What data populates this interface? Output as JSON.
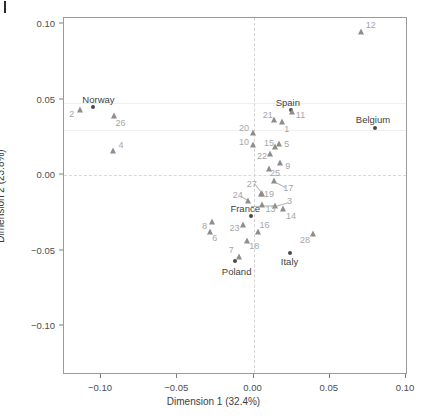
{
  "chart_data": {
    "type": "scatter",
    "title": "",
    "xlabel": "Dimension 1 (32.4%)",
    "ylabel": "Dimension 2 (23.8%)",
    "xlim": [
      -0.125,
      0.102
    ],
    "ylim": [
      -0.122,
      0.103
    ],
    "xticks": [
      -0.1,
      -0.05,
      0.0,
      0.05,
      0.1
    ],
    "xticklabels": [
      "-0.10",
      "-0.05",
      "0.00",
      "0.05",
      "0.10"
    ],
    "yticks": [
      0.1,
      0.05,
      0.0,
      -0.05,
      -0.1
    ],
    "yticklabels": [
      "0.10",
      "0.05",
      "0.00",
      "-0.05",
      "-0.10"
    ],
    "grid": false,
    "reference_lines": [
      {
        "axis": "x",
        "value": 0.0,
        "style": "dashed"
      },
      {
        "axis": "y",
        "value": 0.0,
        "style": "dashed"
      }
    ],
    "series": [
      {
        "name": "countries",
        "marker": "circle",
        "color": "#4a4a4a",
        "points": [
          {
            "label": "Norway",
            "x": -0.1045,
            "y": 0.0447,
            "lx": -0.101,
            "ly": 0.05
          },
          {
            "label": "Spain",
            "x": 0.025,
            "y": 0.0425,
            "lx": 0.0232,
            "ly": 0.048
          },
          {
            "label": "Belgium",
            "x": 0.08,
            "y": 0.0303,
            "lx": 0.079,
            "ly": 0.0365
          },
          {
            "label": "France",
            "x": -0.0013,
            "y": -0.0277,
            "lx": -0.0048,
            "ly": -0.0228
          },
          {
            "label": "Italy",
            "x": 0.0248,
            "y": -0.052,
            "lx": 0.0243,
            "ly": -0.0578
          },
          {
            "label": "Poland",
            "x": -0.0112,
            "y": -0.0578,
            "lx": -0.0104,
            "ly": -0.064
          }
        ]
      },
      {
        "name": "brands",
        "marker": "triangle",
        "color": "#8e8e8e",
        "points": [
          {
            "label": "12",
            "x": 0.0713,
            "y": 0.0943,
            "lx": 0.0775,
            "ly": 0.0985
          },
          {
            "label": "2",
            "x": -0.1128,
            "y": 0.0422,
            "lx": -0.1185,
            "ly": 0.04
          },
          {
            "label": "26",
            "x": -0.091,
            "y": 0.0385,
            "lx": -0.0865,
            "ly": 0.0337
          },
          {
            "label": "4",
            "x": -0.0912,
            "y": 0.0155,
            "lx": -0.0862,
            "ly": 0.019
          },
          {
            "label": "11",
            "x": 0.0258,
            "y": 0.0408,
            "lx": 0.0315,
            "ly": 0.039
          },
          {
            "label": "21",
            "x": 0.0143,
            "y": 0.0358,
            "lx": 0.01,
            "ly": 0.0392
          },
          {
            "label": "1",
            "x": 0.0193,
            "y": 0.0347,
            "lx": 0.0225,
            "ly": 0.0295
          },
          {
            "label": "20",
            "x": 0.0,
            "y": 0.027,
            "lx": -0.0055,
            "ly": 0.0303
          },
          {
            "label": "10",
            "x": 0.0003,
            "y": 0.0195,
            "lx": -0.0055,
            "ly": 0.0215
          },
          {
            "label": "15",
            "x": 0.0147,
            "y": 0.0178,
            "lx": 0.0108,
            "ly": 0.0207
          },
          {
            "label": "5",
            "x": 0.0172,
            "y": 0.02,
            "lx": 0.0225,
            "ly": 0.0198
          },
          {
            "label": "22",
            "x": 0.0115,
            "y": 0.0135,
            "lx": 0.0063,
            "ly": 0.012
          },
          {
            "label": "9",
            "x": 0.0182,
            "y": 0.0073,
            "lx": 0.0232,
            "ly": 0.005
          },
          {
            "label": "25",
            "x": 0.0108,
            "y": 0.0033,
            "lx": 0.0148,
            "ly": 0.0005
          },
          {
            "label": "17",
            "x": 0.014,
            "y": -0.0048,
            "lx": 0.0235,
            "ly": -0.0093
          },
          {
            "label": "27",
            "x": 0.0062,
            "y": -0.0132,
            "lx": -0.0005,
            "ly": -0.0063
          },
          {
            "label": "19",
            "x": 0.0055,
            "y": -0.0135,
            "lx": 0.0108,
            "ly": -0.0133
          },
          {
            "label": "24",
            "x": -0.003,
            "y": -0.0177,
            "lx": -0.0097,
            "ly": -0.014
          },
          {
            "label": "3",
            "x": 0.0145,
            "y": -0.0212,
            "lx": 0.0243,
            "ly": -0.0178
          },
          {
            "label": "13",
            "x": 0.0062,
            "y": -0.0203,
            "lx": 0.0118,
            "ly": -0.0232
          },
          {
            "label": "14",
            "x": 0.0197,
            "y": -0.0235,
            "lx": 0.0252,
            "ly": -0.0275
          },
          {
            "label": "8",
            "x": -0.0268,
            "y": -0.0318,
            "lx": -0.0315,
            "ly": -0.0345
          },
          {
            "label": "23",
            "x": -0.006,
            "y": -0.034,
            "lx": -0.0118,
            "ly": -0.0355
          },
          {
            "label": "16",
            "x": 0.0035,
            "y": -0.0382,
            "lx": 0.0078,
            "ly": -0.034
          },
          {
            "label": "6",
            "x": -0.0278,
            "y": -0.0382,
            "lx": -0.0247,
            "ly": -0.0425
          },
          {
            "label": "28",
            "x": 0.0395,
            "y": -0.0398,
            "lx": 0.0345,
            "ly": -0.0435
          },
          {
            "label": "18",
            "x": -0.0035,
            "y": -0.0447,
            "lx": 0.0012,
            "ly": -0.048
          },
          {
            "label": "7",
            "x": -0.009,
            "y": -0.0552,
            "lx": -0.014,
            "ly": -0.05
          }
        ]
      }
    ],
    "leader_lines": [
      {
        "x1": 0.014,
        "y1": -0.0048,
        "x2": 0.0215,
        "y2": -0.0088
      },
      {
        "x1": 0.0062,
        "y1": -0.0132,
        "x2": 0.0015,
        "y2": -0.0072
      },
      {
        "x1": -0.003,
        "y1": -0.0177,
        "x2": -0.0085,
        "y2": -0.0148
      },
      {
        "x1": 0.0145,
        "y1": -0.0212,
        "x2": 0.023,
        "y2": -0.0188
      },
      {
        "x1": -0.0013,
        "y1": -0.0213,
        "x2": 0.0138,
        "y2": -0.0208
      }
    ]
  }
}
